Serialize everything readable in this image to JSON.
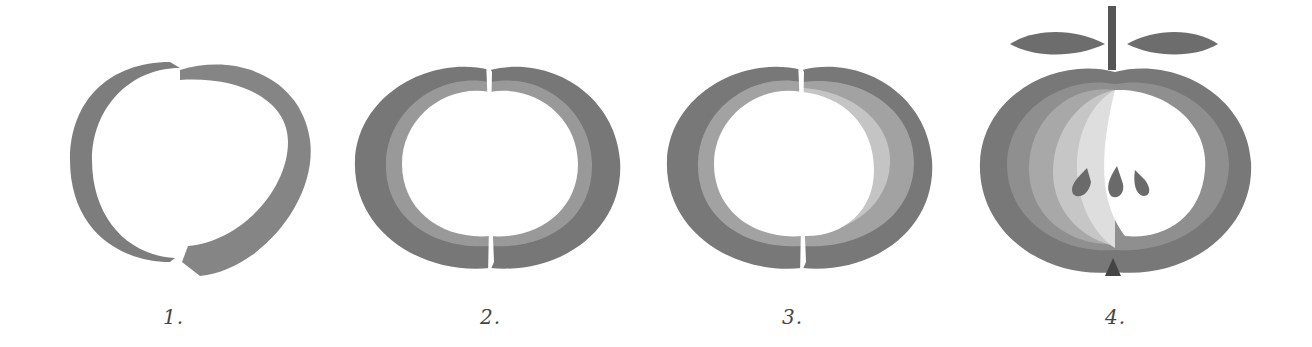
{
  "steps": [
    {
      "label": "1."
    },
    {
      "label": "2."
    },
    {
      "label": "3."
    },
    {
      "label": "4."
    }
  ],
  "colors": {
    "outer": "#7a7a7a",
    "mid": "#959595",
    "light": "#b9b9b9",
    "lighter": "#d6d6d6",
    "core": "#ffffff",
    "dark": "#555555"
  }
}
